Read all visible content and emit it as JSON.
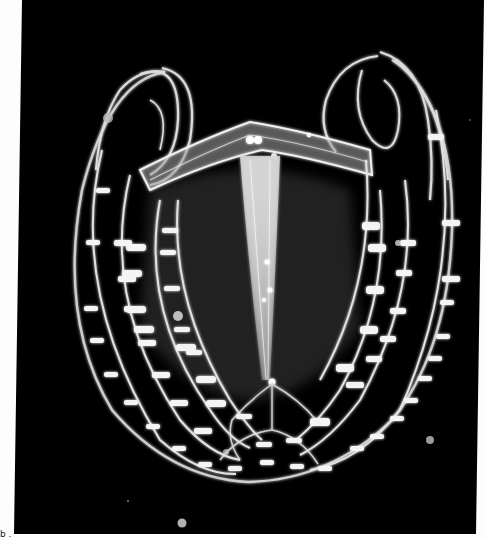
{
  "image": {
    "subject": "comb jelly (ctenophore)",
    "background_color": "#000000",
    "page_color": "#fdfdfd",
    "body_color": "#e8e8e8",
    "glow_color": "#ffffff",
    "caption_mark": "b ."
  }
}
